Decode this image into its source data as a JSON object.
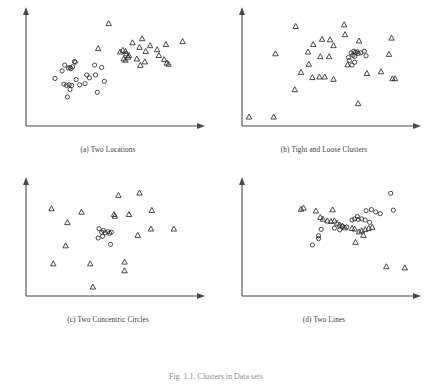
{
  "figure": {
    "caption": "Fig. 1.1. Clusters in Data sets",
    "panel_count": 4
  },
  "chart_data": [
    {
      "type": "scatter",
      "title": "(a) Two Locations",
      "xlabel": "",
      "ylabel": "",
      "xlim": [
        0,
        100
      ],
      "ylim": [
        0,
        100
      ],
      "grid": false,
      "legend": null,
      "axis_style": "arrow-terminated L-shaped axes, no tick labels",
      "series": [
        {
          "name": "circles",
          "marker": "circle",
          "points": [
            [
              20.5,
              47.5
            ],
            [
              22.0,
              52.5
            ],
            [
              24.0,
              50.0
            ],
            [
              25.0,
              50.5
            ],
            [
              25.5,
              49.5
            ],
            [
              26.5,
              51.0
            ],
            [
              27.5,
              55.5
            ],
            [
              28.0,
              55.0
            ],
            [
              16.5,
              41.0
            ],
            [
              21.5,
              36.0
            ],
            [
              23.0,
              35.0
            ],
            [
              24.5,
              35.5
            ],
            [
              26.0,
              35.0
            ],
            [
              25.0,
              31.5
            ],
            [
              28.5,
              40.0
            ],
            [
              30.5,
              35.5
            ],
            [
              33.5,
              36.5
            ],
            [
              34.5,
              44.0
            ],
            [
              36.0,
              41.5
            ],
            [
              39.0,
              52.5
            ],
            [
              39.5,
              44.0
            ],
            [
              40.5,
              29.0
            ],
            [
              43.0,
              50.5
            ],
            [
              44.5,
              38.5
            ],
            [
              23.5,
              25.0
            ]
          ]
        },
        {
          "name": "triangles",
          "marker": "triangle",
          "points": [
            [
              47.0,
              88.5
            ],
            [
              41.0,
              67.0
            ],
            [
              53.5,
              64.0
            ],
            [
              55.0,
              65.5
            ],
            [
              56.5,
              64.5
            ],
            [
              57.0,
              62.5
            ],
            [
              58.5,
              61.0
            ],
            [
              55.5,
              58.0
            ],
            [
              56.5,
              57.0
            ],
            [
              58.0,
              59.5
            ],
            [
              60.5,
              72.0
            ],
            [
              64.5,
              68.0
            ],
            [
              66.0,
              75.5
            ],
            [
              68.0,
              64.5
            ],
            [
              70.5,
              69.5
            ],
            [
              63.0,
              58.0
            ],
            [
              67.5,
              55.5
            ],
            [
              65.0,
              52.5
            ],
            [
              74.5,
              66.0
            ],
            [
              75.5,
              61.0
            ],
            [
              79.5,
              70.5
            ],
            [
              78.5,
              57.5
            ],
            [
              80.0,
              54.5
            ],
            [
              81.0,
              53.5
            ],
            [
              89.0,
              73.0
            ]
          ]
        }
      ]
    },
    {
      "type": "scatter",
      "title": "(b) Tight and Loose Clusters",
      "xlabel": "",
      "ylabel": "",
      "xlim": [
        0,
        100
      ],
      "ylim": [
        0,
        100
      ],
      "grid": false,
      "legend": null,
      "axis_style": "arrow-terminated L-shaped axes, no tick labels",
      "series": [
        {
          "name": "circles",
          "marker": "circle",
          "points": [
            [
              62.0,
              63.0
            ],
            [
              63.5,
              64.5
            ],
            [
              64.5,
              63.5
            ],
            [
              65.5,
              64.0
            ],
            [
              66.0,
              62.5
            ],
            [
              63.0,
              61.0
            ],
            [
              64.0,
              60.0
            ],
            [
              60.5,
              59.0
            ],
            [
              61.0,
              56.5
            ],
            [
              67.5,
              63.0
            ],
            [
              69.5,
              64.5
            ],
            [
              70.5,
              60.5
            ],
            [
              62.5,
              52.5
            ],
            [
              64.0,
              55.0
            ]
          ]
        },
        {
          "name": "triangles",
          "marker": "triangle",
          "points": [
            [
              30.5,
              86.0
            ],
            [
              58.0,
              87.5
            ],
            [
              58.5,
              79.0
            ],
            [
              45.5,
              75.0
            ],
            [
              50.0,
              74.5
            ],
            [
              40.5,
              70.5
            ],
            [
              52.0,
              69.5
            ],
            [
              66.5,
              73.5
            ],
            [
              85.0,
              76.0
            ],
            [
              19.0,
              62.5
            ],
            [
              37.5,
              64.0
            ],
            [
              44.5,
              60.0
            ],
            [
              49.5,
              60.0
            ],
            [
              83.5,
              62.0
            ],
            [
              38.0,
              53.5
            ],
            [
              60.0,
              53.0
            ],
            [
              33.5,
              46.5
            ],
            [
              40.0,
              42.0
            ],
            [
              44.0,
              42.5
            ],
            [
              47.0,
              42.5
            ],
            [
              52.0,
              40.5
            ],
            [
              71.0,
              45.5
            ],
            [
              79.0,
              47.0
            ],
            [
              85.5,
              41.0
            ],
            [
              87.0,
              41.0
            ],
            [
              30.0,
              31.5
            ],
            [
              66.0,
              19.5
            ],
            [
              18.0,
              8.0
            ],
            [
              4.0,
              8.0
            ]
          ]
        }
      ]
    },
    {
      "type": "scatter",
      "title": "(c) Two Concentric Circles",
      "xlabel": "",
      "ylabel": "",
      "xlim": [
        0,
        100
      ],
      "ylim": [
        0,
        100
      ],
      "grid": false,
      "legend": null,
      "axis_style": "arrow-terminated L-shaped axes, no tick labels",
      "series": [
        {
          "name": "circles",
          "marker": "circle",
          "points": [
            [
              41.5,
              58.0
            ],
            [
              43.0,
              55.0
            ],
            [
              44.0,
              56.5
            ],
            [
              45.0,
              54.5
            ],
            [
              46.5,
              55.5
            ],
            [
              47.5,
              54.0
            ],
            [
              48.5,
              55.0
            ],
            [
              43.5,
              51.5
            ],
            [
              41.0,
              50.0
            ],
            [
              48.0,
              44.5
            ]
          ]
        },
        {
          "name": "triangles",
          "marker": "triangle",
          "points": [
            [
              52.5,
              87.0
            ],
            [
              64.5,
              89.0
            ],
            [
              14.5,
              75.5
            ],
            [
              31.5,
              72.5
            ],
            [
              50.0,
              70.5
            ],
            [
              50.5,
              69.0
            ],
            [
              58.5,
              70.5
            ],
            [
              71.5,
              74.0
            ],
            [
              23.5,
              63.5
            ],
            [
              71.0,
              58.0
            ],
            [
              84.0,
              58.0
            ],
            [
              63.5,
              52.5
            ],
            [
              22.5,
              43.5
            ],
            [
              15.5,
              28.0
            ],
            [
              36.5,
              28.0
            ],
            [
              56.0,
              29.5
            ],
            [
              56.0,
              22.0
            ],
            [
              38.0,
              8.0
            ]
          ]
        }
      ]
    },
    {
      "type": "scatter",
      "title": "(d) Two Lines",
      "xlabel": "",
      "ylabel": "",
      "xlim": [
        0,
        100
      ],
      "ylim": [
        0,
        100
      ],
      "grid": false,
      "legend": null,
      "axis_style": "arrow-terminated L-shaped axes, no tick labels",
      "series": [
        {
          "name": "circles",
          "marker": "circle",
          "points": [
            [
              84.5,
              88.5
            ],
            [
              86.0,
              74.0
            ],
            [
              70.5,
              73.5
            ],
            [
              73.5,
              74.5
            ],
            [
              76.0,
              72.5
            ],
            [
              78.5,
              71.0
            ],
            [
              65.5,
              68.5
            ],
            [
              62.5,
              65.5
            ],
            [
              64.0,
              66.5
            ],
            [
              66.0,
              66.0
            ],
            [
              68.0,
              66.5
            ],
            [
              70.0,
              65.5
            ],
            [
              72.5,
              63.5
            ],
            [
              57.0,
              60.0
            ],
            [
              59.5,
              59.5
            ],
            [
              55.5,
              57.0
            ],
            [
              52.5,
              58.5
            ],
            [
              45.0,
              57.5
            ],
            [
              43.5,
              52.0
            ],
            [
              43.5,
              49.5
            ],
            [
              40.0,
              44.0
            ]
          ]
        },
        {
          "name": "triangles",
          "marker": "triangle",
          "points": [
            [
              33.5,
              75.0
            ],
            [
              35.0,
              76.0
            ],
            [
              42.0,
              73.5
            ],
            [
              51.5,
              74.5
            ],
            [
              44.5,
              68.0
            ],
            [
              46.0,
              66.5
            ],
            [
              48.5,
              65.0
            ],
            [
              50.5,
              64.5
            ],
            [
              52.5,
              65.0
            ],
            [
              54.0,
              63.0
            ],
            [
              55.5,
              61.5
            ],
            [
              57.0,
              60.5
            ],
            [
              58.5,
              59.0
            ],
            [
              62.5,
              58.5
            ],
            [
              64.0,
              58.0
            ],
            [
              66.5,
              55.5
            ],
            [
              68.0,
              56.5
            ],
            [
              70.0,
              57.5
            ],
            [
              72.0,
              58.5
            ],
            [
              74.0,
              59.5
            ],
            [
              69.0,
              52.5
            ],
            [
              64.5,
              46.5
            ],
            [
              82.0,
              25.5
            ],
            [
              92.5,
              24.5
            ]
          ]
        }
      ]
    }
  ]
}
